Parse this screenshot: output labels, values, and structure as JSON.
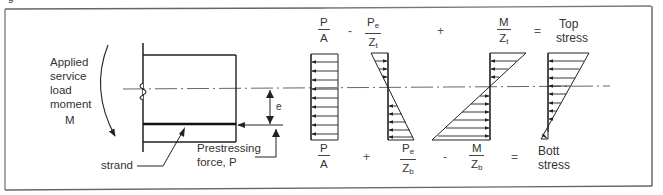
{
  "figure": {
    "caption_fragment": "g"
  },
  "beam": {
    "moment_label_lines": [
      "Applied",
      "service",
      "load",
      "moment",
      "M"
    ],
    "strand_label": "strand",
    "prestress_label_lines": [
      "Prestressing",
      "force, P"
    ],
    "eccentricity_label": "e"
  },
  "top_equation": {
    "terms": [
      {
        "num": "P",
        "den": "A",
        "den_sub": ""
      },
      {
        "num": "P",
        "num_sub": "e",
        "den": "Z",
        "den_sub": "t"
      },
      {
        "num": "M",
        "den": "Z",
        "den_sub": "t"
      }
    ],
    "operators": [
      "-",
      "+",
      "="
    ],
    "result_lines": [
      "Top",
      "stress"
    ]
  },
  "bottom_equation": {
    "terms": [
      {
        "num": "P",
        "den": "A",
        "den_sub": ""
      },
      {
        "num": "P",
        "num_sub": "e",
        "den": "Z",
        "den_sub": "b"
      },
      {
        "num": "M",
        "den": "Z",
        "den_sub": "b"
      }
    ],
    "operators": [
      "+",
      "-",
      "="
    ],
    "result_lines": [
      "Bott",
      "stress"
    ]
  },
  "stress_diagrams": [
    {
      "name": "uniform-axial",
      "shape": "rectangle"
    },
    {
      "name": "eccentric-prestress",
      "shape": "triangles-opposite"
    },
    {
      "name": "applied-moment",
      "shape": "triangles-opposite"
    },
    {
      "name": "resultant",
      "shape": "trapezoid-compression-top"
    }
  ]
}
